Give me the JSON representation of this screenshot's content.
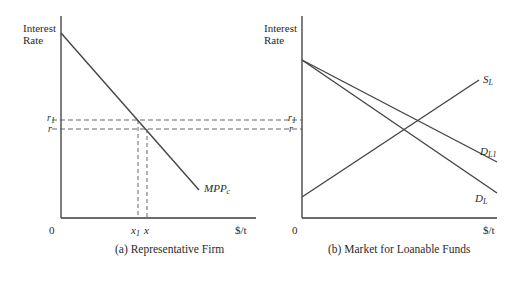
{
  "panel_a": {
    "y_label_line1": "Interest",
    "y_label_line2": "Rate",
    "origin": "0",
    "x_axis_unit": "$/t",
    "r1_label": "r",
    "r1_sub": "1",
    "r_label": "r",
    "x1_label": "x",
    "x1_sub": "1",
    "x_label": "x",
    "curve_label": "MPP",
    "curve_sub": "c",
    "caption": "(a) Representative Firm"
  },
  "panel_b": {
    "y_label_line1": "Interest",
    "y_label_line2": "Rate",
    "origin": "0",
    "x_axis_unit": "$/t",
    "r1_label": "r",
    "r1_sub": "1",
    "r_label": "r",
    "supply_label": "S",
    "supply_sub": "L",
    "demand1_label": "D",
    "demand1_sub": "L1",
    "demand_label": "D",
    "demand_sub": "L",
    "caption": "(b) Market for Loanable Funds"
  },
  "colors": {
    "axis": "#3a3a3a",
    "curve": "#444444",
    "dash": "#555555"
  }
}
